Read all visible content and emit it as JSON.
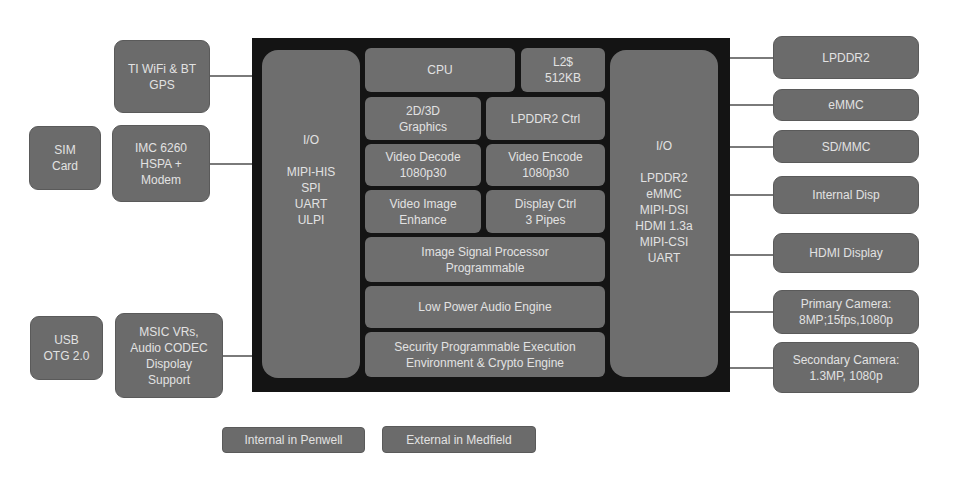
{
  "chip": {
    "left_io": {
      "title": "I/O",
      "items": [
        "MIPI-HIS",
        "SPI",
        "UART",
        "ULPI"
      ]
    },
    "right_io": {
      "title": "I/O",
      "items": [
        "LPDDR2",
        "eMMC",
        "MIPI-DSI",
        "HDMI 1.3a",
        "MIPI-CSI",
        "UART"
      ]
    },
    "blocks": {
      "cpu": [
        "CPU"
      ],
      "l2": [
        "L2$",
        "512KB"
      ],
      "graphics": [
        "2D/3D",
        "Graphics"
      ],
      "lpddr2_ctrl": [
        "LPDDR2 Ctrl"
      ],
      "video_decode": [
        "Video Decode",
        "1080p30"
      ],
      "video_encode": [
        "Video Encode",
        "1080p30"
      ],
      "video_enhance": [
        "Video Image",
        "Enhance"
      ],
      "display_ctrl": [
        "Display Ctrl",
        "3 Pipes"
      ],
      "isp": [
        "Image Signal Processor",
        "Programmable"
      ],
      "audio": [
        "Low Power Audio Engine"
      ],
      "security": [
        "Security Programmable Execution",
        "Environment & Crypto Engine"
      ]
    }
  },
  "left_components": {
    "wifi": [
      "TI WiFi & BT",
      "GPS"
    ],
    "modem": [
      "IMC 6260",
      "HSPA +",
      "Modem"
    ],
    "sim": [
      "SIM",
      "Card"
    ],
    "usb": [
      "USB",
      "OTG 2.0"
    ],
    "msic": [
      "MSIC VRs,",
      "Audio CODEC",
      "Dispolay",
      "Support"
    ]
  },
  "right_components": {
    "lpddr2": [
      "LPDDR2"
    ],
    "emmc": [
      "eMMC"
    ],
    "sdmmc": [
      "SD/MMC"
    ],
    "internal_disp": [
      "Internal Disp"
    ],
    "hdmi_display": [
      "HDMI Display"
    ],
    "primary_camera": [
      "Primary Camera:",
      "8MP;15fps,1080p"
    ],
    "secondary_camera": [
      "Secondary Camera:",
      "1.3MP, 1080p"
    ]
  },
  "legend": {
    "internal": "Internal in Penwell",
    "external": "External in Medfield"
  },
  "colors": {
    "block_fill": "#6b6b6b",
    "frame": "#141414",
    "text": "#e2e2e2",
    "connector": "#7a7a7a"
  }
}
